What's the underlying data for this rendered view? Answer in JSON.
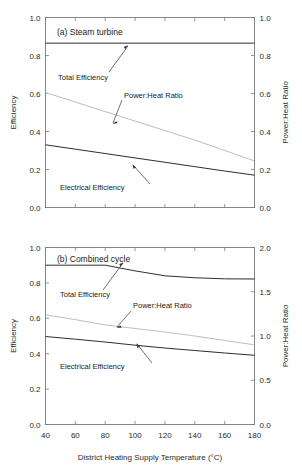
{
  "figure": {
    "width": 302,
    "height": 474,
    "background": "#ffffff",
    "line_color_dark": "#222222",
    "line_color_light": "#b9b9b9",
    "axis_color": "#7b7b7b"
  },
  "xaxis": {
    "label": "District Heating Supply Temperature (°C)",
    "ticks": [
      40,
      60,
      80,
      100,
      120,
      140,
      160,
      180
    ],
    "tick_labels": [
      "40",
      "60",
      "80",
      "100",
      "120",
      "140",
      "160",
      "180"
    ],
    "min": 40,
    "max": 180
  },
  "panels": [
    {
      "id": "a",
      "caption": "(a) Steam turbine",
      "left_axis": {
        "label": "Efficiency",
        "min": 0.0,
        "max": 1.0,
        "ticks": [
          0.0,
          0.2,
          0.4,
          0.6,
          0.8,
          1.0
        ],
        "tick_labels": [
          "0.0",
          "0.2",
          "0.4",
          "0.6",
          "0.8",
          "1.0"
        ]
      },
      "right_axis": {
        "label": "Power:Heat Ratio",
        "min": 0.0,
        "max": 1.0,
        "ticks": [
          0.0,
          0.2,
          0.4,
          0.6,
          0.8,
          1.0
        ],
        "tick_labels": [
          "0.0",
          "0.2",
          "0.4",
          "0.6",
          "0.8",
          "1.0"
        ]
      },
      "annotations": [
        {
          "text": "Total Efficiency"
        },
        {
          "text": "Power:Heat Ratio"
        },
        {
          "text": "Electrical Efficiency"
        }
      ]
    },
    {
      "id": "b",
      "caption": "(b) Combined cycle",
      "left_axis": {
        "label": "Efficiency",
        "min": 0.0,
        "max": 1.0,
        "ticks": [
          0.0,
          0.2,
          0.4,
          0.6,
          0.8,
          1.0
        ],
        "tick_labels": [
          "0.0",
          "0.2",
          "0.4",
          "0.6",
          "0.8",
          "1.0"
        ]
      },
      "right_axis": {
        "label": "Power:Heat Ratio",
        "min": 0.0,
        "max": 2.0,
        "ticks": [
          0.0,
          0.5,
          1.0,
          1.5,
          2.0
        ],
        "tick_labels": [
          "0.0",
          "0.5",
          "1.0",
          "1.5",
          "2.0"
        ]
      },
      "annotations": [
        {
          "text": "Total Efficiency"
        },
        {
          "text": "Power:Heat Ratio"
        },
        {
          "text": "Electrical Efficiency"
        }
      ]
    }
  ],
  "chart_data": [
    {
      "type": "line",
      "title": "(a) Steam turbine",
      "xlabel": "District Heating Supply Temperature (°C)",
      "ylabel": "Efficiency",
      "y2label": "Power:Heat Ratio",
      "xlim": [
        40,
        180
      ],
      "ylim": [
        0.0,
        1.0
      ],
      "y2lim": [
        0.0,
        1.0
      ],
      "grid": false,
      "legend": "inline-annotations",
      "x": [
        40,
        60,
        80,
        100,
        120,
        140,
        160,
        180
      ],
      "series": [
        {
          "name": "Total Efficiency",
          "axis": "left",
          "color": "#222222",
          "values": [
            0.865,
            0.865,
            0.865,
            0.865,
            0.865,
            0.865,
            0.865,
            0.865
          ]
        },
        {
          "name": "Electrical Efficiency",
          "axis": "left",
          "color": "#222222",
          "values": [
            0.33,
            0.307,
            0.284,
            0.261,
            0.238,
            0.215,
            0.192,
            0.17
          ]
        },
        {
          "name": "Power:Heat Ratio",
          "axis": "right",
          "color": "#b9b9b9",
          "values": [
            0.605,
            0.555,
            0.505,
            0.455,
            0.405,
            0.355,
            0.3,
            0.245
          ]
        }
      ]
    },
    {
      "type": "line",
      "title": "(b) Combined cycle",
      "xlabel": "District Heating Supply Temperature (°C)",
      "ylabel": "Efficiency",
      "y2label": "Power:Heat Ratio",
      "xlim": [
        40,
        180
      ],
      "ylim": [
        0.0,
        1.0
      ],
      "y2lim": [
        0.0,
        2.0
      ],
      "grid": false,
      "legend": "inline-annotations",
      "x": [
        40,
        60,
        80,
        100,
        120,
        140,
        160,
        180
      ],
      "series": [
        {
          "name": "Total Efficiency",
          "axis": "left",
          "color": "#222222",
          "values": [
            0.9,
            0.9,
            0.9,
            0.868,
            0.84,
            0.829,
            0.823,
            0.822
          ]
        },
        {
          "name": "Electrical Efficiency",
          "axis": "left",
          "color": "#222222",
          "values": [
            0.497,
            0.482,
            0.466,
            0.448,
            0.432,
            0.418,
            0.404,
            0.391
          ]
        },
        {
          "name": "Power:Heat Ratio",
          "axis": "right",
          "color": "#b9b9b9",
          "values": [
            1.24,
            1.185,
            1.125,
            1.085,
            1.045,
            1.0,
            0.95,
            0.9
          ]
        }
      ]
    }
  ]
}
